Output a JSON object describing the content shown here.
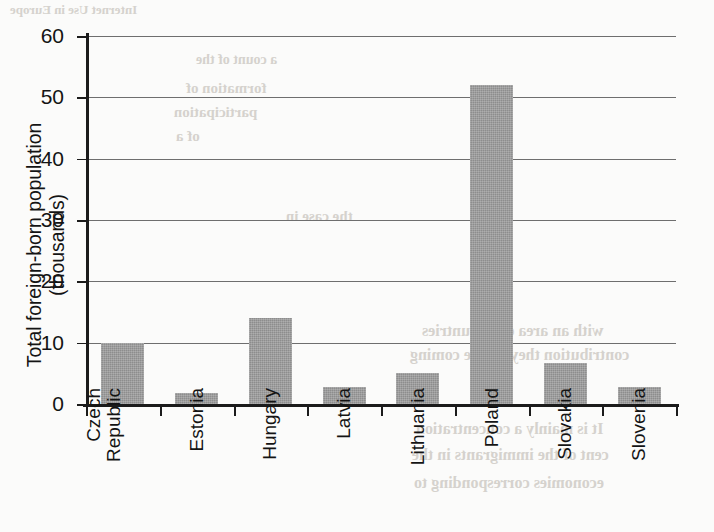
{
  "chart_data": {
    "type": "bar",
    "title": "",
    "xlabel": "",
    "ylabel": "Total foreign-born population (thousands)",
    "categories": [
      "Czech Republic",
      "Estonia",
      "Hungary",
      "Latvia",
      "Lithuania",
      "Poland",
      "Slovakia",
      "Slovenia"
    ],
    "category_lines": [
      [
        "Czech",
        "Republic"
      ],
      [
        "Estonia",
        ""
      ],
      [
        "Hungary",
        ""
      ],
      [
        "Latvia",
        ""
      ],
      [
        "Lithuania",
        ""
      ],
      [
        "Poland",
        ""
      ],
      [
        "Slovakia",
        ""
      ],
      [
        "Slovenia",
        ""
      ]
    ],
    "values": [
      10,
      1.8,
      14,
      2.8,
      5,
      52,
      6.7,
      2.8
    ],
    "ylim": [
      0,
      60
    ],
    "yticks": [
      0,
      10,
      20,
      30,
      40,
      50,
      60
    ],
    "ytick_labels": [
      "0",
      "10",
      "20",
      "30",
      "40",
      "50",
      "60"
    ],
    "grid": true,
    "legend": "none",
    "bar_color": "#8d8d8d",
    "axis_color": "#1b1b1b",
    "grid_color": "#6e6e6e",
    "background_color": "#fbfbfa"
  },
  "bleed_text": [
    {
      "text": "Internet Use in Europe",
      "x": 10,
      "y": 2,
      "size": 13
    },
    {
      "text": "a count of the",
      "x": 196,
      "y": 52,
      "size": 14
    },
    {
      "text": "formation of",
      "x": 186,
      "y": 80,
      "size": 15
    },
    {
      "text": "participation",
      "x": 174,
      "y": 104,
      "size": 15
    },
    {
      "text": "of a",
      "x": 176,
      "y": 128,
      "size": 15
    },
    {
      "text": "the case in",
      "x": 286,
      "y": 208,
      "size": 15
    },
    {
      "text": "with an area of 5 countries",
      "x": 422,
      "y": 322,
      "size": 16
    },
    {
      "text": "contribution they all are coming",
      "x": 410,
      "y": 346,
      "size": 16
    },
    {
      "text": "the",
      "x": 472,
      "y": 372,
      "size": 16
    },
    {
      "text": "It is mainly a concentration",
      "x": 416,
      "y": 420,
      "size": 16
    },
    {
      "text": "cent of the immigrants in the",
      "x": 412,
      "y": 446,
      "size": 16
    },
    {
      "text": "economies corresponding to",
      "x": 414,
      "y": 474,
      "size": 16
    }
  ]
}
